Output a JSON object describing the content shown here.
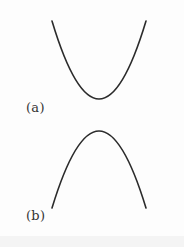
{
  "figure": {
    "panels": [
      {
        "id": "a",
        "label": "(a)",
        "curve": "upward-opening parabola",
        "start": [
          52,
          21
        ],
        "vertex": [
          99,
          99
        ],
        "end": [
          146,
          21
        ]
      },
      {
        "id": "b",
        "label": "(b)",
        "curve": "downward-opening parabola",
        "start": [
          52,
          208
        ],
        "vertex": [
          99,
          131
        ],
        "end": [
          146,
          208
        ]
      }
    ],
    "stroke_color": "#2b2b2b",
    "background_color": "#fdfdfd"
  }
}
